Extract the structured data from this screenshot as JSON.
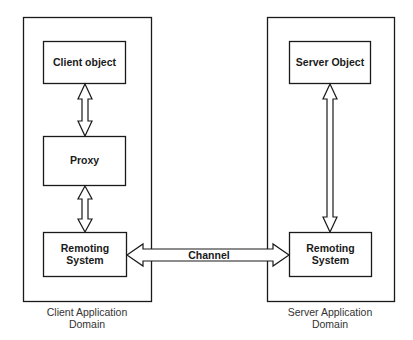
{
  "diagram": {
    "title": "",
    "client_domain": {
      "label_line1": "Client Application",
      "label_line2": "Domain",
      "client_object": "Client object",
      "proxy": "Proxy",
      "remoting_line1": "Remoting",
      "remoting_line2": "System"
    },
    "server_domain": {
      "label_line1": "Server Application",
      "label_line2": "Domain",
      "server_object": "Server Object",
      "remoting_line1": "Remoting",
      "remoting_line2": "System"
    },
    "channel": {
      "label": "Channel"
    },
    "connections": [
      {
        "from": "Client object",
        "to": "Proxy",
        "type": "bidirectional"
      },
      {
        "from": "Proxy",
        "to": "Remoting System (client)",
        "type": "bidirectional"
      },
      {
        "from": "Remoting System (client)",
        "to": "Remoting System (server)",
        "type": "bidirectional",
        "label": "Channel"
      },
      {
        "from": "Server Object",
        "to": "Remoting System (server)",
        "type": "bidirectional"
      }
    ]
  }
}
